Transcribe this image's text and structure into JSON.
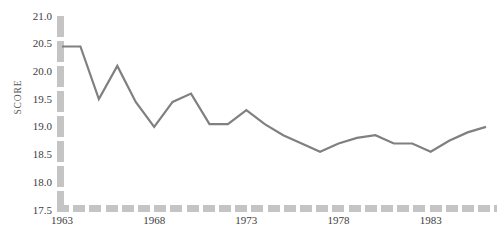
{
  "title_remnant": "",
  "axes": {
    "y_label": "SCORE",
    "y_ticks": [
      "17.5",
      "18.0",
      "18.5",
      "19.0",
      "19.5",
      "20.0",
      "20.5",
      "21.0"
    ],
    "x_ticks": [
      "1963",
      "1968",
      "1973",
      "1978",
      "1983"
    ]
  },
  "colors": {
    "line": "#808080",
    "axis": "#c4c4c4",
    "text": "#3d3d3d",
    "background": "#ffffff"
  },
  "chart_data": {
    "type": "line",
    "title": "",
    "xlabel": "",
    "ylabel": "SCORE",
    "xlim": [
      1963,
      1986
    ],
    "ylim": [
      17.5,
      21.0
    ],
    "ytick_step": 0.5,
    "xtick_step": 5,
    "grid": false,
    "legend": null,
    "x": [
      1963,
      1964,
      1965,
      1966,
      1967,
      1968,
      1969,
      1970,
      1971,
      1972,
      1973,
      1974,
      1975,
      1976,
      1977,
      1978,
      1979,
      1980,
      1981,
      1982,
      1983,
      1984,
      1985,
      1986
    ],
    "values": [
      20.45,
      20.45,
      19.5,
      20.1,
      19.45,
      19.0,
      19.45,
      19.6,
      19.05,
      19.05,
      19.3,
      19.05,
      18.85,
      18.7,
      18.55,
      18.7,
      18.8,
      18.85,
      18.7,
      18.7,
      18.55,
      18.75,
      18.9,
      19.0
    ],
    "series": [
      {
        "name": "SCORE",
        "values": [
          20.45,
          20.45,
          19.5,
          20.1,
          19.45,
          19.0,
          19.45,
          19.6,
          19.05,
          19.05,
          19.3,
          19.05,
          18.85,
          18.7,
          18.55,
          18.7,
          18.8,
          18.85,
          18.7,
          18.7,
          18.55,
          18.75,
          18.9,
          19.0
        ]
      }
    ]
  }
}
